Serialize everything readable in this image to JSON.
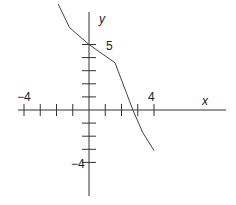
{
  "chart_data": {
    "type": "line",
    "title": "",
    "xlabel": "x",
    "ylabel": "y",
    "x_tick_labels": [
      {
        "value": -4,
        "text": "-4"
      },
      {
        "value": 4,
        "text": "4"
      }
    ],
    "y_tick_labels": [
      {
        "value": 5,
        "text": "5"
      },
      {
        "value": -4,
        "text": "-4"
      }
    ],
    "x_ticks": [
      -4,
      -3,
      -2,
      -1,
      1,
      2,
      3,
      4
    ],
    "y_ticks": [
      -4,
      -3,
      -2,
      -1,
      1,
      2,
      3,
      4,
      5
    ],
    "xlim": [
      -4.5,
      8
    ],
    "ylim": [
      -7,
      8.5
    ],
    "grid": false,
    "legend": null,
    "series": [
      {
        "name": "f(x)",
        "points": [
          {
            "x": -1.9,
            "y": 8.1
          },
          {
            "x": -1.2,
            "y": 6.3
          },
          {
            "x": 0,
            "y": 5
          },
          {
            "x": 1.6,
            "y": 3.6
          },
          {
            "x": 2.7,
            "y": 0
          },
          {
            "x": 3.3,
            "y": -1.7
          },
          {
            "x": 4.0,
            "y": -3.1
          }
        ]
      }
    ]
  },
  "labels": {
    "x_axis": "x",
    "y_axis": "y",
    "x_neg": "−4",
    "x_pos": "4",
    "y_pos": "5",
    "y_neg": "−4"
  }
}
